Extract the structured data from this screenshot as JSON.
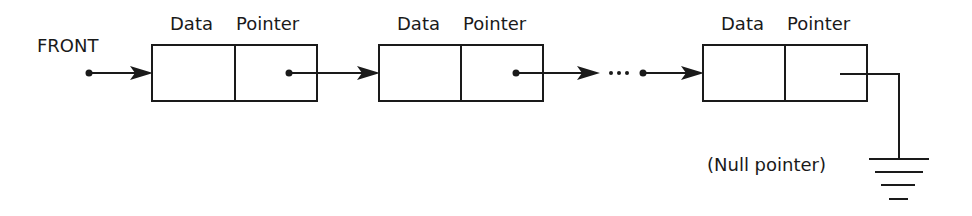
{
  "diagram": {
    "type": "singly-linked-list",
    "front_label": "FRONT",
    "null_label": "(Null pointer)",
    "ellipsis": "…",
    "colors": {
      "stroke": "#1a1a1a",
      "background": "#ffffff"
    },
    "nodes": [
      {
        "data_label": "Data",
        "pointer_label": "Pointer",
        "pointer": "next"
      },
      {
        "data_label": "Data",
        "pointer_label": "Pointer",
        "pointer": "next"
      },
      {
        "data_label": "Data",
        "pointer_label": "Pointer",
        "pointer": "null"
      }
    ],
    "icons": {
      "terminator": "ground-symbol-icon",
      "pointer_origin": "dot-icon",
      "link": "arrow-right-icon"
    }
  }
}
